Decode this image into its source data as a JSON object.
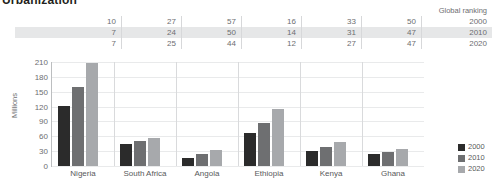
{
  "chart_data": {
    "type": "bar",
    "title": "Urbanization",
    "categories": [
      "Nigeria",
      "South Africa",
      "Angola",
      "Ethiopia",
      "Kenya",
      "Ghana"
    ],
    "series": [
      {
        "name": "2000",
        "color": "#2b2b2b",
        "values": [
          122,
          45,
          16,
          66,
          31,
          25
        ]
      },
      {
        "name": "2010",
        "color": "#6e6f71",
        "values": [
          160,
          50,
          24,
          87,
          39,
          29
        ]
      },
      {
        "name": "2020",
        "color": "#a7a9ac",
        "values": [
          208,
          56,
          33,
          115,
          48,
          34
        ]
      }
    ],
    "xlabel": "",
    "ylabel": "Millions",
    "ylim": [
      0,
      210
    ],
    "yticks": [
      0,
      30,
      60,
      90,
      120,
      150,
      180,
      210
    ],
    "grid": true,
    "legend_position": "bottom-right"
  },
  "rank_table": {
    "header": "Global ranking",
    "years": [
      "2000",
      "2010",
      "2020"
    ],
    "rows": [
      {
        "year": "2000",
        "values": [
          "10",
          "27",
          "57",
          "16",
          "33",
          "50"
        ]
      },
      {
        "year": "2010",
        "values": [
          "7",
          "24",
          "50",
          "14",
          "31",
          "47"
        ]
      },
      {
        "year": "2020",
        "values": [
          "7",
          "25",
          "44",
          "12",
          "27",
          "47"
        ]
      }
    ]
  }
}
